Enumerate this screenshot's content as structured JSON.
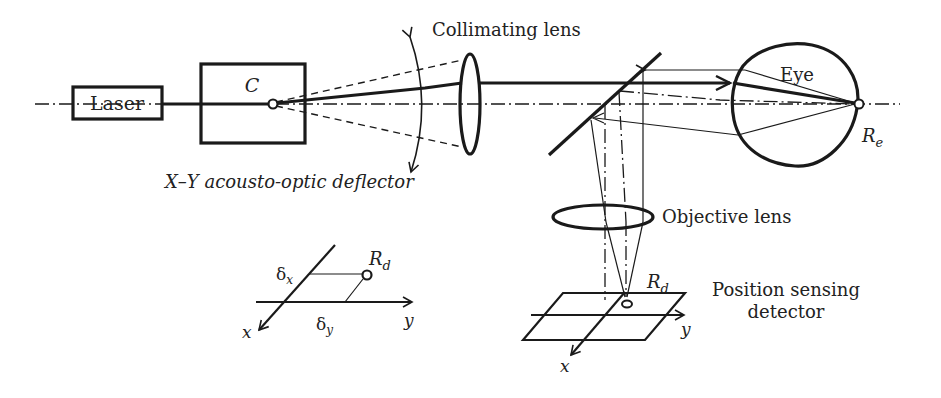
{
  "figure": {
    "type": "optical-system-schematic",
    "colors": {
      "ink": "#1a1a1a",
      "background": "#ffffff"
    }
  },
  "components": {
    "laser": {
      "label": "Laser"
    },
    "deflector": {
      "box_label": "C",
      "caption": "X–Y acousto-optic deflector"
    },
    "collimating_lens": {
      "label": "Collimating lens"
    },
    "eye": {
      "label": "Eye",
      "point_label_main": "R",
      "point_label_sub": "e"
    },
    "objective_lens": {
      "label": "Objective lens"
    },
    "detector": {
      "label_line1": "Position sensing",
      "label_line2": "detector",
      "point_label_main": "R",
      "point_label_sub": "d",
      "axis_x": "x",
      "axis_y": "y"
    }
  },
  "inset": {
    "point_label_main": "R",
    "point_label_sub": "d",
    "delta_x_main": "δ",
    "delta_x_sub": "x",
    "delta_y_main": "δ",
    "delta_y_sub": "y",
    "axis_x": "x",
    "axis_y": "y"
  }
}
